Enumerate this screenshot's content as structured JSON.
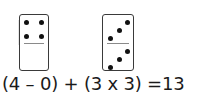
{
  "dominoes": [
    {
      "name": "domino-4-0",
      "top_value": 4,
      "bottom_value": 0,
      "top_pips": [
        {
          "x": 4,
          "y": 5
        },
        {
          "x": 19,
          "y": 5
        },
        {
          "x": 4,
          "y": 19
        },
        {
          "x": 19,
          "y": 19
        }
      ],
      "bottom_pips": []
    },
    {
      "name": "domino-3-3",
      "top_value": 3,
      "bottom_value": 3,
      "top_pips": [
        {
          "x": 22,
          "y": 5
        },
        {
          "x": 14,
          "y": 13
        },
        {
          "x": 5,
          "y": 21
        }
      ],
      "bottom_pips": [
        {
          "x": 22,
          "y": 34
        },
        {
          "x": 14,
          "y": 42
        },
        {
          "x": 5,
          "y": 50
        }
      ]
    }
  ],
  "equation": {
    "text": "(4 – 0) + (3 x 3) =13"
  },
  "colors": {
    "pip": "#111111",
    "border": "#3a3a3a",
    "divider": "#8a8a8a",
    "text": "#1a1a1a"
  }
}
